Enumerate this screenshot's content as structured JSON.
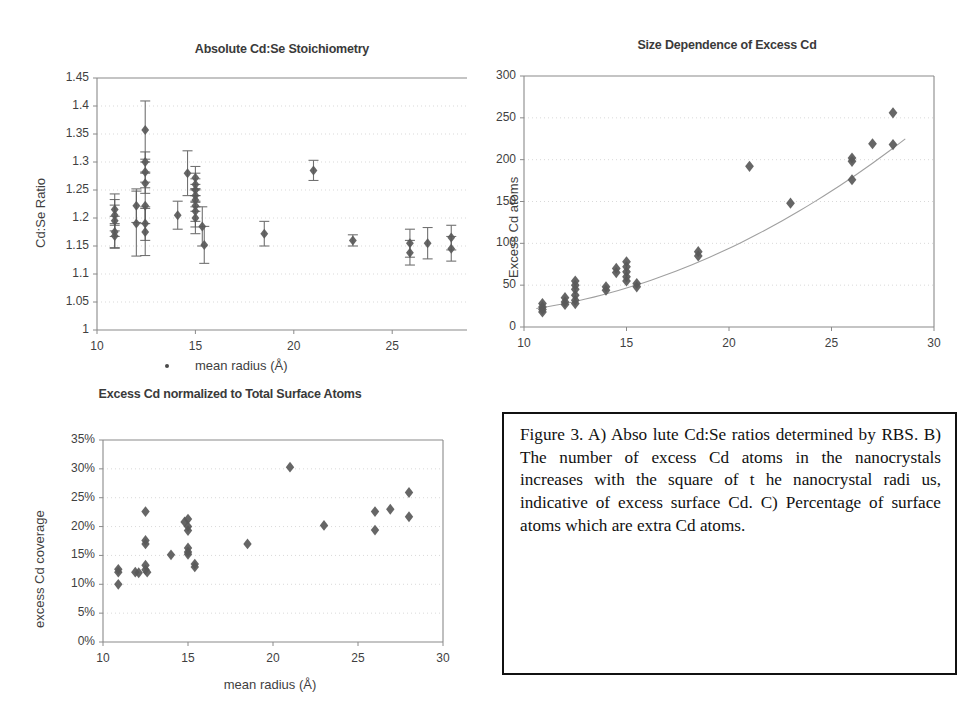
{
  "figure": {
    "caption_label": "Figure 3.",
    "caption_text": "Figure 3.   A) Abso lute Cd:Se ratios determined by RBS. B) The number of excess Cd atoms in the nanocrystals increases with the square of t he nanocrystal radi us, indicative of excess surface Cd.  C) Percentage of surface atoms which are extra Cd atoms.",
    "marker_color": "#595959",
    "axis_color": "#8a8a8a",
    "grid_color": "#c9c9c9",
    "text_color": "#3f3f3f"
  },
  "panel_a": {
    "legend_marker_label": "mean radius (Å)"
  },
  "chart_data": [
    {
      "id": "panel-a",
      "type": "scatter",
      "title": "Absolute Cd:Se Stoichiometry",
      "xlabel": "mean radius (Å)",
      "ylabel": "Cd:Se Ratio",
      "xlim": [
        10,
        28.8
      ],
      "ylim": [
        1,
        1.45
      ],
      "xticks": [
        10,
        15,
        20,
        25
      ],
      "yticks": [
        1,
        1.05,
        1.1,
        1.15,
        1.2,
        1.25,
        1.3,
        1.35,
        1.4,
        1.45
      ],
      "ytick_labels": [
        "1",
        "1.05",
        "1.1",
        "1.15",
        "1.2",
        "1.25",
        "1.3",
        "1.35",
        "1.4",
        "1.45"
      ],
      "xtick_labels": [
        "10",
        "15",
        "20",
        "25"
      ],
      "grid": true,
      "errorbars": true,
      "legend": "mean radius (Å)",
      "points": [
        {
          "x": 10.9,
          "y": 1.215,
          "err": 0.028
        },
        {
          "x": 10.9,
          "y": 1.205,
          "err": 0.028
        },
        {
          "x": 10.9,
          "y": 1.195,
          "err": 0.028
        },
        {
          "x": 10.9,
          "y": 1.175,
          "err": 0.028
        },
        {
          "x": 10.9,
          "y": 1.168,
          "err": 0.022
        },
        {
          "x": 12.0,
          "y": 1.19,
          "err": 0.058
        },
        {
          "x": 12.0,
          "y": 1.222,
          "err": 0.03
        },
        {
          "x": 12.45,
          "y": 1.357,
          "err": 0.052
        },
        {
          "x": 12.45,
          "y": 1.3,
          "err": 0.018
        },
        {
          "x": 12.45,
          "y": 1.282,
          "err": 0.018
        },
        {
          "x": 12.45,
          "y": 1.262,
          "err": 0.018
        },
        {
          "x": 12.45,
          "y": 1.222,
          "err": 0.032
        },
        {
          "x": 12.45,
          "y": 1.19,
          "err": 0.03
        },
        {
          "x": 12.45,
          "y": 1.175,
          "err": 0.042
        },
        {
          "x": 14.1,
          "y": 1.205,
          "err": 0.025
        },
        {
          "x": 14.6,
          "y": 1.28,
          "err": 0.04
        },
        {
          "x": 15.0,
          "y": 1.272,
          "err": 0.02
        },
        {
          "x": 15.0,
          "y": 1.26,
          "err": 0.02
        },
        {
          "x": 15.0,
          "y": 1.25,
          "err": 0.02
        },
        {
          "x": 15.0,
          "y": 1.24,
          "err": 0.02
        },
        {
          "x": 15.0,
          "y": 1.232,
          "err": 0.02
        },
        {
          "x": 15.0,
          "y": 1.222,
          "err": 0.028
        },
        {
          "x": 15.0,
          "y": 1.212,
          "err": 0.028
        },
        {
          "x": 15.0,
          "y": 1.2,
          "err": 0.028
        },
        {
          "x": 15.35,
          "y": 1.185,
          "err": 0.035
        },
        {
          "x": 15.45,
          "y": 1.152,
          "err": 0.033
        },
        {
          "x": 18.5,
          "y": 1.172,
          "err": 0.022
        },
        {
          "x": 21.0,
          "y": 1.285,
          "err": 0.018
        },
        {
          "x": 23.0,
          "y": 1.16,
          "err": 0.01
        },
        {
          "x": 25.9,
          "y": 1.155,
          "err": 0.025
        },
        {
          "x": 25.9,
          "y": 1.138,
          "err": 0.022
        },
        {
          "x": 26.8,
          "y": 1.155,
          "err": 0.028
        },
        {
          "x": 28.0,
          "y": 1.165,
          "err": 0.022
        },
        {
          "x": 28.0,
          "y": 1.145,
          "err": 0.022
        }
      ]
    },
    {
      "id": "panel-b",
      "type": "scatter",
      "title": "Size Dependence of Excess Cd",
      "xlabel": "mean radius (Å)",
      "ylabel": "Excess Cd atoms",
      "xlim": [
        10,
        30
      ],
      "ylim": [
        0,
        300
      ],
      "xticks": [
        10,
        15,
        20,
        25,
        30
      ],
      "yticks": [
        0,
        50,
        100,
        150,
        200,
        250,
        300
      ],
      "xtick_labels": [
        "10",
        "15",
        "20",
        "25",
        "30"
      ],
      "ytick_labels": [
        "0",
        "50",
        "100",
        "150",
        "200",
        "250",
        "300"
      ],
      "grid": true,
      "trendline": true,
      "trendline_note": "quadratic fit rising from ~25 at r=11 to ~250 at r=28",
      "points": [
        {
          "x": 10.9,
          "y": 28
        },
        {
          "x": 10.9,
          "y": 24
        },
        {
          "x": 10.9,
          "y": 21
        },
        {
          "x": 10.9,
          "y": 18
        },
        {
          "x": 12.0,
          "y": 35
        },
        {
          "x": 12.0,
          "y": 30
        },
        {
          "x": 12.0,
          "y": 27
        },
        {
          "x": 12.5,
          "y": 55
        },
        {
          "x": 12.5,
          "y": 50
        },
        {
          "x": 12.5,
          "y": 45
        },
        {
          "x": 12.5,
          "y": 38
        },
        {
          "x": 12.5,
          "y": 32
        },
        {
          "x": 12.5,
          "y": 28
        },
        {
          "x": 14.0,
          "y": 48
        },
        {
          "x": 14.0,
          "y": 44
        },
        {
          "x": 14.5,
          "y": 70
        },
        {
          "x": 14.5,
          "y": 65
        },
        {
          "x": 15.0,
          "y": 78
        },
        {
          "x": 15.0,
          "y": 72
        },
        {
          "x": 15.0,
          "y": 66
        },
        {
          "x": 15.0,
          "y": 60
        },
        {
          "x": 15.0,
          "y": 55
        },
        {
          "x": 15.5,
          "y": 52
        },
        {
          "x": 15.5,
          "y": 48
        },
        {
          "x": 18.5,
          "y": 90
        },
        {
          "x": 18.5,
          "y": 85
        },
        {
          "x": 21.0,
          "y": 192
        },
        {
          "x": 23.0,
          "y": 148
        },
        {
          "x": 26.0,
          "y": 202
        },
        {
          "x": 26.0,
          "y": 198
        },
        {
          "x": 26.0,
          "y": 176
        },
        {
          "x": 27.0,
          "y": 219
        },
        {
          "x": 28.0,
          "y": 256
        },
        {
          "x": 28.0,
          "y": 218
        }
      ]
    },
    {
      "id": "panel-c",
      "type": "scatter",
      "title": "Excess Cd normalized to Total Surface Atoms",
      "xlabel": "mean radius (Å)",
      "ylabel": "excess  Cd  coverage",
      "xlim": [
        10,
        30
      ],
      "ylim": [
        0,
        35
      ],
      "xticks": [
        10,
        15,
        20,
        25,
        30
      ],
      "yticks": [
        0,
        5,
        10,
        15,
        20,
        25,
        30,
        35
      ],
      "xtick_labels": [
        "10",
        "15",
        "20",
        "25",
        "30"
      ],
      "ytick_labels": [
        "0%",
        "5%",
        "10%",
        "15%",
        "20%",
        "25%",
        "30%",
        "35%"
      ],
      "grid": true,
      "units": "percent",
      "points": [
        {
          "x": 10.9,
          "y": 12.6
        },
        {
          "x": 10.9,
          "y": 12.1
        },
        {
          "x": 10.9,
          "y": 10.0
        },
        {
          "x": 11.9,
          "y": 12.1
        },
        {
          "x": 12.1,
          "y": 12.0
        },
        {
          "x": 12.5,
          "y": 22.6
        },
        {
          "x": 12.5,
          "y": 17.6
        },
        {
          "x": 12.5,
          "y": 17.0
        },
        {
          "x": 12.5,
          "y": 13.3
        },
        {
          "x": 12.5,
          "y": 12.5
        },
        {
          "x": 12.6,
          "y": 12.1
        },
        {
          "x": 14.0,
          "y": 15.1
        },
        {
          "x": 14.8,
          "y": 20.8
        },
        {
          "x": 15.0,
          "y": 21.3
        },
        {
          "x": 15.0,
          "y": 20.0
        },
        {
          "x": 15.0,
          "y": 19.3
        },
        {
          "x": 15.0,
          "y": 16.3
        },
        {
          "x": 15.0,
          "y": 15.6
        },
        {
          "x": 15.0,
          "y": 15.2
        },
        {
          "x": 15.4,
          "y": 13.5
        },
        {
          "x": 15.4,
          "y": 13.0
        },
        {
          "x": 18.5,
          "y": 17.0
        },
        {
          "x": 21.0,
          "y": 30.3
        },
        {
          "x": 23.0,
          "y": 20.2
        },
        {
          "x": 26.0,
          "y": 22.6
        },
        {
          "x": 26.0,
          "y": 19.4
        },
        {
          "x": 26.9,
          "y": 23.0
        },
        {
          "x": 28.0,
          "y": 25.9
        },
        {
          "x": 28.0,
          "y": 21.7
        }
      ]
    }
  ]
}
